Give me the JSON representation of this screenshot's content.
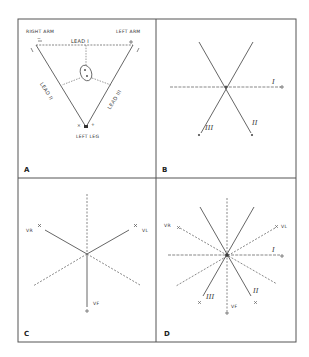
{
  "figure": {
    "colors": {
      "line": "#555555",
      "frame": "#555555",
      "background": "#ffffff"
    },
    "panels": [
      {
        "id": "A",
        "label": "A",
        "description": "Einthoven triangle",
        "vertices": {
          "right_arm": "RIGHT ARM",
          "left_arm": "LEFT ARM",
          "left_leg": "LEFT LEG"
        },
        "lead_labels": {
          "lead_1": "LEAD I",
          "lead_2": "LEAD II",
          "lead_3": "LEAD III"
        },
        "polarity": {
          "right_arm": "−",
          "left_arm": "+",
          "left_leg_neg": "×",
          "left_leg_pos": "+"
        }
      },
      {
        "id": "B",
        "label": "B",
        "description": "Triaxial reference system",
        "leads": {
          "lead_1": "I",
          "lead_2": "II",
          "lead_3": "III"
        },
        "polarity": {
          "plus": "+",
          "minus": "−"
        }
      },
      {
        "id": "C",
        "label": "C",
        "description": "Unipolar limb leads",
        "leads": {
          "vr": "VR",
          "vl": "VL",
          "vf": "VF"
        },
        "polarity": {
          "plus": "+",
          "x": "×"
        }
      },
      {
        "id": "D",
        "label": "D",
        "description": "Hexaxial reference system",
        "leads": {
          "lead_1": "I",
          "lead_2": "II",
          "lead_3": "III",
          "vr": "VR",
          "vl": "VL",
          "vf": "VF"
        },
        "polarity": {
          "plus": "+",
          "x": "×"
        }
      }
    ]
  }
}
